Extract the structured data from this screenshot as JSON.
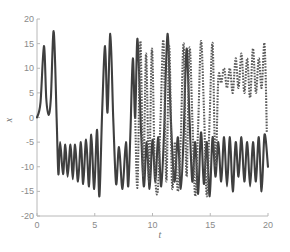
{
  "chart_data": {
    "type": "line",
    "title": "",
    "xlabel": "t",
    "ylabel": "x",
    "xlim": [
      0,
      20
    ],
    "ylim": [
      -20,
      20
    ],
    "xticks": [
      0,
      5,
      10,
      15,
      20
    ],
    "yticks": [
      20,
      15,
      10,
      5,
      0,
      -5,
      -10,
      -15,
      -20
    ],
    "xtick_labels": [
      "0",
      "5",
      "10",
      "15",
      "20"
    ],
    "ytick_labels": [
      "20",
      "15",
      "10",
      "5",
      "0",
      "-5",
      "-10",
      "-15",
      "-20"
    ],
    "grid": false,
    "legend": null,
    "series": [
      {
        "name": "trajectory-1",
        "style": "solid",
        "color": "#3f3f3f",
        "x": [
          0,
          0.3,
          0.6,
          0.8,
          1.0,
          1.2,
          1.45,
          1.7,
          1.85,
          2.0,
          2.25,
          2.45,
          2.65,
          2.9,
          3.1,
          3.3,
          3.55,
          3.8,
          4.0,
          4.25,
          4.5,
          4.7,
          4.95,
          5.2,
          5.4,
          5.65,
          5.9,
          6.1,
          6.35,
          6.6,
          6.85,
          7.1,
          7.4,
          7.7,
          7.9,
          8.1,
          8.3,
          8.5,
          8.7,
          9.0,
          9.25,
          9.5,
          9.75,
          10.0,
          10.25,
          10.5,
          10.75,
          11.0,
          11.3,
          11.6,
          11.9,
          12.2,
          12.45,
          12.7,
          12.95,
          13.2,
          13.45,
          13.7,
          13.95,
          14.2,
          14.45,
          14.7,
          14.95,
          15.2,
          15.45,
          15.7,
          15.95,
          16.2,
          16.45,
          16.7,
          16.95,
          17.2,
          17.45,
          17.7,
          17.95,
          18.2,
          18.45,
          18.7,
          18.95,
          19.2,
          19.45,
          19.7,
          20.0
        ],
        "y": [
          0,
          3,
          14.5,
          4,
          0.5,
          4,
          17.5,
          0,
          -11.5,
          -5,
          -11.5,
          -5.5,
          -12,
          -5.5,
          -12.5,
          -5.5,
          -13,
          -5,
          -13.5,
          -4.5,
          -14,
          -3.5,
          -14.5,
          -2.5,
          -16,
          2,
          14.5,
          1,
          17,
          0,
          -13.5,
          -6,
          -14.5,
          -5,
          -14,
          -2,
          12,
          0,
          16,
          -2,
          -14,
          -5,
          -14.5,
          -4.5,
          -13,
          -4,
          -14,
          -3,
          17,
          -1,
          -13,
          -4,
          -14.5,
          -3.5,
          14,
          0,
          -13,
          -5,
          -15.5,
          -3,
          -13.5,
          -5,
          -16,
          -4,
          -12,
          -5,
          -13,
          -4,
          -14,
          -4,
          -15,
          -5,
          -12,
          -4,
          -13,
          -5,
          -14,
          -5,
          -13,
          -4,
          -15,
          -3.5,
          -10
        ]
      },
      {
        "name": "trajectory-2",
        "style": "dashed",
        "color": "#5a5a5a",
        "x": [
          8.5,
          8.7,
          8.95,
          9.2,
          9.45,
          9.7,
          9.95,
          10.2,
          10.45,
          10.7,
          10.95,
          11.2,
          11.45,
          11.7,
          11.95,
          12.2,
          12.45,
          12.7,
          12.95,
          13.2,
          13.45,
          13.7,
          13.95,
          14.2,
          14.45,
          14.7,
          14.95,
          15.2,
          15.45,
          15.7,
          15.95,
          16.2,
          16.45,
          16.7,
          16.95,
          17.2,
          17.45,
          17.7,
          17.95,
          18.2,
          18.45,
          18.7,
          18.95,
          19.2,
          19.45,
          19.7,
          19.9
        ],
        "y": [
          0,
          -14,
          15.5,
          -12,
          13,
          -13,
          14,
          -10,
          -15,
          0,
          15.5,
          -13,
          14.5,
          -14,
          -5,
          -15,
          -4,
          15,
          -12,
          14,
          0,
          -16,
          -2,
          15.5,
          2,
          -16,
          0,
          15,
          -10,
          8,
          7,
          10,
          6,
          10,
          5,
          12,
          6,
          13,
          5,
          12,
          4,
          14,
          5,
          12,
          6,
          15,
          -3
        ]
      }
    ]
  }
}
